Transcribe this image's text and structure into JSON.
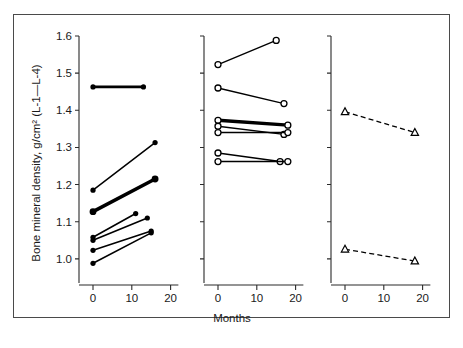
{
  "figure": {
    "ylabel": "Bone mineral density, g/cm² (L-1—L-4)",
    "xlabel": "Months",
    "frame_color": "#4a4a4a",
    "ink_color": "#000000",
    "background": "#ffffff"
  },
  "chart_data": {
    "type": "line",
    "title": "",
    "xlabel": "Months",
    "ylabel": "Bone mineral density, g/cm² (L-1—L-4)",
    "xlim": [
      -4,
      22
    ],
    "ylim": [
      0.94,
      1.63
    ],
    "grid": false,
    "legend": null,
    "yticks": [
      1.0,
      1.1,
      1.2,
      1.3,
      1.4,
      1.5,
      1.6
    ],
    "ytick_labels": [
      "1.0",
      "1.1",
      "1.2",
      "1.3",
      "1.4",
      "1.5",
      "1.6"
    ],
    "xticks": [
      0,
      10,
      20
    ],
    "xtick_labels": [
      "0",
      "10",
      "20"
    ],
    "panels": [
      {
        "name": "panel-left",
        "marker": "filled-circle",
        "linestyle": "solid",
        "yaxis_labels_visible": true,
        "series": [
          {
            "name": "subject-1",
            "x": [
              0,
              13
            ],
            "y": [
              1.463,
              1.463
            ],
            "linewidth": 2.6
          },
          {
            "name": "subject-2",
            "x": [
              0,
              16
            ],
            "y": [
              1.185,
              1.313
            ],
            "linewidth": 1.5
          },
          {
            "name": "subject-3",
            "x": [
              0,
              16
            ],
            "y": [
              1.127,
              1.215
            ],
            "linewidth": 3.6
          },
          {
            "name": "subject-4",
            "x": [
              0,
              11
            ],
            "y": [
              1.058,
              1.122
            ],
            "linewidth": 1.6
          },
          {
            "name": "subject-5",
            "x": [
              0,
              14
            ],
            "y": [
              1.05,
              1.11
            ],
            "linewidth": 1.6
          },
          {
            "name": "subject-6",
            "x": [
              0,
              15
            ],
            "y": [
              1.023,
              1.075
            ],
            "linewidth": 1.6
          },
          {
            "name": "subject-7",
            "x": [
              0,
              15
            ],
            "y": [
              0.988,
              1.07
            ],
            "linewidth": 1.6
          }
        ]
      },
      {
        "name": "panel-middle",
        "marker": "open-circle",
        "linestyle": "solid",
        "yaxis_labels_visible": false,
        "series": [
          {
            "name": "subject-8",
            "x": [
              0,
              15
            ],
            "y": [
              1.523,
              1.588
            ],
            "linewidth": 1.4
          },
          {
            "name": "subject-9",
            "x": [
              0,
              17
            ],
            "y": [
              1.46,
              1.418
            ],
            "linewidth": 1.4
          },
          {
            "name": "subject-10",
            "x": [
              0,
              18
            ],
            "y": [
              1.373,
              1.36
            ],
            "linewidth": 3.4
          },
          {
            "name": "subject-11",
            "x": [
              0,
              17
            ],
            "y": [
              1.357,
              1.335
            ],
            "linewidth": 1.4
          },
          {
            "name": "subject-12",
            "x": [
              0,
              18
            ],
            "y": [
              1.34,
              1.34
            ],
            "linewidth": 1.6
          },
          {
            "name": "subject-13",
            "x": [
              0,
              16
            ],
            "y": [
              1.285,
              1.262
            ],
            "linewidth": 1.5
          },
          {
            "name": "subject-14",
            "x": [
              0,
              18
            ],
            "y": [
              1.262,
              1.262
            ],
            "linewidth": 1.5
          }
        ]
      },
      {
        "name": "panel-right",
        "marker": "open-triangle",
        "linestyle": "dashed",
        "yaxis_labels_visible": false,
        "series": [
          {
            "name": "subject-15",
            "x": [
              0,
              18
            ],
            "y": [
              1.396,
              1.34
            ],
            "linewidth": 1.3
          },
          {
            "name": "subject-16",
            "x": [
              0,
              18
            ],
            "y": [
              1.026,
              0.994
            ],
            "linewidth": 1.3
          }
        ]
      }
    ]
  }
}
